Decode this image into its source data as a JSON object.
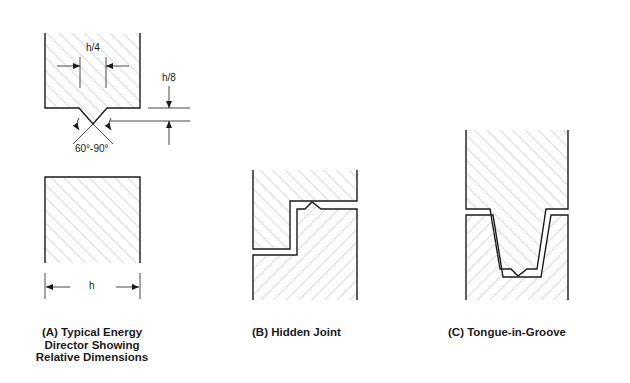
{
  "figures": [
    {
      "id": "A",
      "caption_lines": [
        "(A) Typical Energy",
        "Director Showing",
        "Relative Dimensions"
      ],
      "dimensions": {
        "width_label": "h/4",
        "height_label": "h/8",
        "angle_label": "60°-90°",
        "base_label": "h"
      }
    },
    {
      "id": "B",
      "caption_lines": [
        "(B) Hidden Joint"
      ]
    },
    {
      "id": "C",
      "caption_lines": [
        "(C) Tongue-in-Groove"
      ]
    }
  ],
  "colors": {
    "stroke": "#1a1a1a",
    "hatch": "#9a9a9a",
    "background": "#ffffff"
  }
}
